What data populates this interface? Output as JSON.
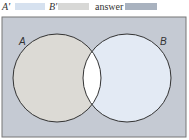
{
  "legend": {
    "items": [
      {
        "label": "A'",
        "color": "#d6e1ef"
      },
      {
        "label": "B'",
        "color": "#d8d8d6"
      },
      {
        "label": "answer",
        "color": "#a9b2bf"
      }
    ]
  },
  "diagram": {
    "type": "venn",
    "universe_color": "#c5cad3",
    "sets": [
      {
        "label": "A",
        "only_color": "#dcdad5"
      },
      {
        "label": "B",
        "only_color": "#e3eaf4"
      }
    ],
    "intersection_color": "#ffffff",
    "outline_color": "#333333"
  }
}
